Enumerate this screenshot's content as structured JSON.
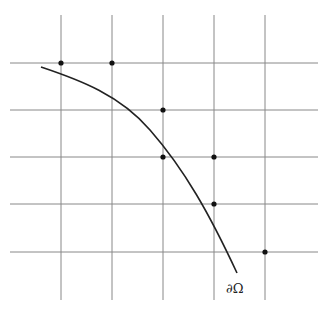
{
  "diagram": {
    "grid": {
      "vertical_x": [
        61,
        112,
        163,
        214,
        265
      ],
      "horizontal_y": [
        63,
        110,
        157,
        204,
        252
      ],
      "v_extent": [
        15,
        300
      ],
      "h_extent": [
        10,
        318
      ],
      "color": "#888888"
    },
    "points": [
      {
        "x": 61,
        "y": 63
      },
      {
        "x": 112,
        "y": 63
      },
      {
        "x": 163,
        "y": 110
      },
      {
        "x": 163,
        "y": 157
      },
      {
        "x": 214,
        "y": 157
      },
      {
        "x": 214,
        "y": 204
      },
      {
        "x": 265,
        "y": 252
      }
    ],
    "boundary_curve": {
      "path": "M41,67 C80,80 120,95 150,130 C185,170 210,215 237,273",
      "color": "#222222"
    },
    "boundary_label": "∂Ω"
  }
}
